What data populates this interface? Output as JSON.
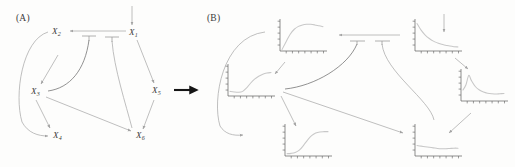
{
  "figure": {
    "type": "diagram",
    "width": 515,
    "height": 167,
    "background_color": "#ffffff"
  },
  "panels": [
    {
      "id": "A",
      "label": "(A)",
      "x": 16,
      "y": 13
    },
    {
      "id": "B",
      "label": "(B)",
      "x": 207,
      "y": 13
    }
  ],
  "transition_arrow": {
    "name": "panel-transition-arrow",
    "color": "#151515",
    "x1": 172,
    "y1": 90,
    "x2": 204,
    "y2": 90
  },
  "panel_a": {
    "nodes": [
      {
        "id": "X1",
        "label": "X",
        "sub": "1",
        "x": 133,
        "y": 33
      },
      {
        "id": "X2",
        "label": "X",
        "sub": "2",
        "x": 55,
        "y": 33
      },
      {
        "id": "X3",
        "label": "X",
        "sub": "3",
        "x": 34,
        "y": 92
      },
      {
        "id": "X4",
        "label": "X",
        "sub": "4",
        "x": 56,
        "y": 135
      },
      {
        "id": "X5",
        "label": "X",
        "sub": "5",
        "x": 156,
        "y": 92
      },
      {
        "id": "X6",
        "label": "X",
        "sub": "6",
        "x": 139,
        "y": 135
      }
    ],
    "edges": [
      {
        "from": "input",
        "to": "X1",
        "type": "activation",
        "style": "straight"
      },
      {
        "from": "X1",
        "to": "X2",
        "type": "activation",
        "style": "straight"
      },
      {
        "from": "X1",
        "to": "X5",
        "type": "activation",
        "style": "straight"
      },
      {
        "from": "X1",
        "to": "X3",
        "type": "inhibition",
        "style": "curved"
      },
      {
        "from": "X1",
        "to": "X6",
        "type": "inhibition",
        "style": "curved"
      },
      {
        "from": "X2",
        "to": "X3",
        "type": "activation",
        "style": "straight"
      },
      {
        "from": "X2",
        "to": "X4",
        "type": "activation",
        "style": "curved"
      },
      {
        "from": "X3",
        "to": "X4",
        "type": "activation",
        "style": "straight"
      },
      {
        "from": "X3",
        "to": "X6",
        "type": "activation",
        "style": "straight"
      },
      {
        "from": "X5",
        "to": "X6",
        "type": "activation",
        "style": "straight"
      }
    ]
  },
  "panel_b": {
    "note": "Each network node is replaced by its time-course trajectory plot",
    "plots": [
      {
        "id": "P1",
        "node": "X1",
        "x": 406,
        "y": 16,
        "w": 58,
        "h": 44,
        "shape": "exponential-decay",
        "chart_data": {
          "type": "line",
          "x": [
            0,
            0.1,
            0.2,
            0.3,
            0.4,
            0.5,
            0.6,
            0.7,
            0.8,
            0.9,
            1.0
          ],
          "y": [
            0.95,
            0.72,
            0.55,
            0.43,
            0.34,
            0.28,
            0.23,
            0.2,
            0.17,
            0.15,
            0.14
          ],
          "xlim": [
            0,
            1
          ],
          "ylim": [
            0,
            1
          ],
          "grid": false
        }
      },
      {
        "id": "P2",
        "node": "X2",
        "x": 271,
        "y": 16,
        "w": 58,
        "h": 44,
        "shape": "rise-and-saturate",
        "chart_data": {
          "type": "line",
          "x": [
            0,
            0.1,
            0.2,
            0.3,
            0.4,
            0.5,
            0.6,
            0.7,
            0.8,
            0.9,
            1.0
          ],
          "y": [
            0.05,
            0.32,
            0.58,
            0.75,
            0.85,
            0.9,
            0.92,
            0.92,
            0.9,
            0.87,
            0.84
          ],
          "xlim": [
            0,
            1
          ],
          "ylim": [
            0,
            1
          ],
          "grid": false
        }
      },
      {
        "id": "P3",
        "node": "X3",
        "x": 219,
        "y": 61,
        "w": 58,
        "h": 44,
        "shape": "flat-then-rise",
        "chart_data": {
          "type": "line",
          "x": [
            0,
            0.1,
            0.2,
            0.3,
            0.4,
            0.5,
            0.6,
            0.7,
            0.8,
            0.9,
            1.0
          ],
          "y": [
            0.16,
            0.14,
            0.13,
            0.15,
            0.27,
            0.44,
            0.58,
            0.68,
            0.75,
            0.79,
            0.81
          ],
          "xlim": [
            0,
            1
          ],
          "ylim": [
            0,
            1
          ],
          "grid": false
        }
      },
      {
        "id": "P4",
        "node": "X4",
        "x": 276,
        "y": 121,
        "w": 58,
        "h": 44,
        "shape": "sigmoid-rise",
        "chart_data": {
          "type": "line",
          "x": [
            0,
            0.1,
            0.2,
            0.3,
            0.4,
            0.5,
            0.6,
            0.7,
            0.8,
            0.9,
            1.0
          ],
          "y": [
            0.08,
            0.09,
            0.12,
            0.2,
            0.36,
            0.55,
            0.7,
            0.79,
            0.83,
            0.84,
            0.84
          ],
          "xlim": [
            0,
            1
          ],
          "ylim": [
            0,
            1
          ],
          "grid": false
        }
      },
      {
        "id": "P5",
        "node": "X5",
        "x": 452,
        "y": 66,
        "w": 58,
        "h": 44,
        "shape": "sharp-peak-then-decay",
        "chart_data": {
          "type": "line",
          "x": [
            0,
            0.07,
            0.14,
            0.2,
            0.3,
            0.4,
            0.5,
            0.6,
            0.7,
            0.8,
            0.9,
            1.0
          ],
          "y": [
            0.38,
            0.55,
            0.88,
            0.72,
            0.5,
            0.38,
            0.31,
            0.27,
            0.25,
            0.24,
            0.25,
            0.26
          ],
          "xlim": [
            0,
            1
          ],
          "ylim": [
            0,
            1
          ],
          "grid": false
        }
      },
      {
        "id": "P6",
        "node": "X6",
        "x": 406,
        "y": 121,
        "w": 58,
        "h": 44,
        "shape": "flat-slight-dip",
        "chart_data": {
          "type": "line",
          "x": [
            0,
            0.1,
            0.2,
            0.3,
            0.4,
            0.5,
            0.6,
            0.7,
            0.8,
            0.9,
            1.0
          ],
          "y": [
            0.36,
            0.34,
            0.32,
            0.3,
            0.28,
            0.26,
            0.25,
            0.25,
            0.26,
            0.27,
            0.27
          ],
          "xlim": [
            0,
            1
          ],
          "ylim": [
            0,
            1
          ],
          "grid": false
        }
      }
    ],
    "edges": [
      {
        "from": "input",
        "to": "P1",
        "type": "activation"
      },
      {
        "from": "P1",
        "to": "P2",
        "type": "activation"
      },
      {
        "from": "P1",
        "to": "P5",
        "type": "activation"
      },
      {
        "from": "P1",
        "to": "P3",
        "type": "inhibition"
      },
      {
        "from": "P1",
        "to": "P6",
        "type": "inhibition"
      },
      {
        "from": "P2",
        "to": "P3",
        "type": "activation"
      },
      {
        "from": "P2",
        "to": "P4",
        "type": "activation"
      },
      {
        "from": "P3",
        "to": "P4",
        "type": "activation"
      },
      {
        "from": "P3",
        "to": "P6",
        "type": "activation"
      },
      {
        "from": "P5",
        "to": "P6",
        "type": "activation"
      }
    ]
  },
  "colors": {
    "edge_gray": "#a9a9a9",
    "edge_dark": "#6e6e6e",
    "axis": "#5d5d5d",
    "curve": "#c8c8c8",
    "text": "#3a3a3a",
    "transition": "#151515"
  }
}
